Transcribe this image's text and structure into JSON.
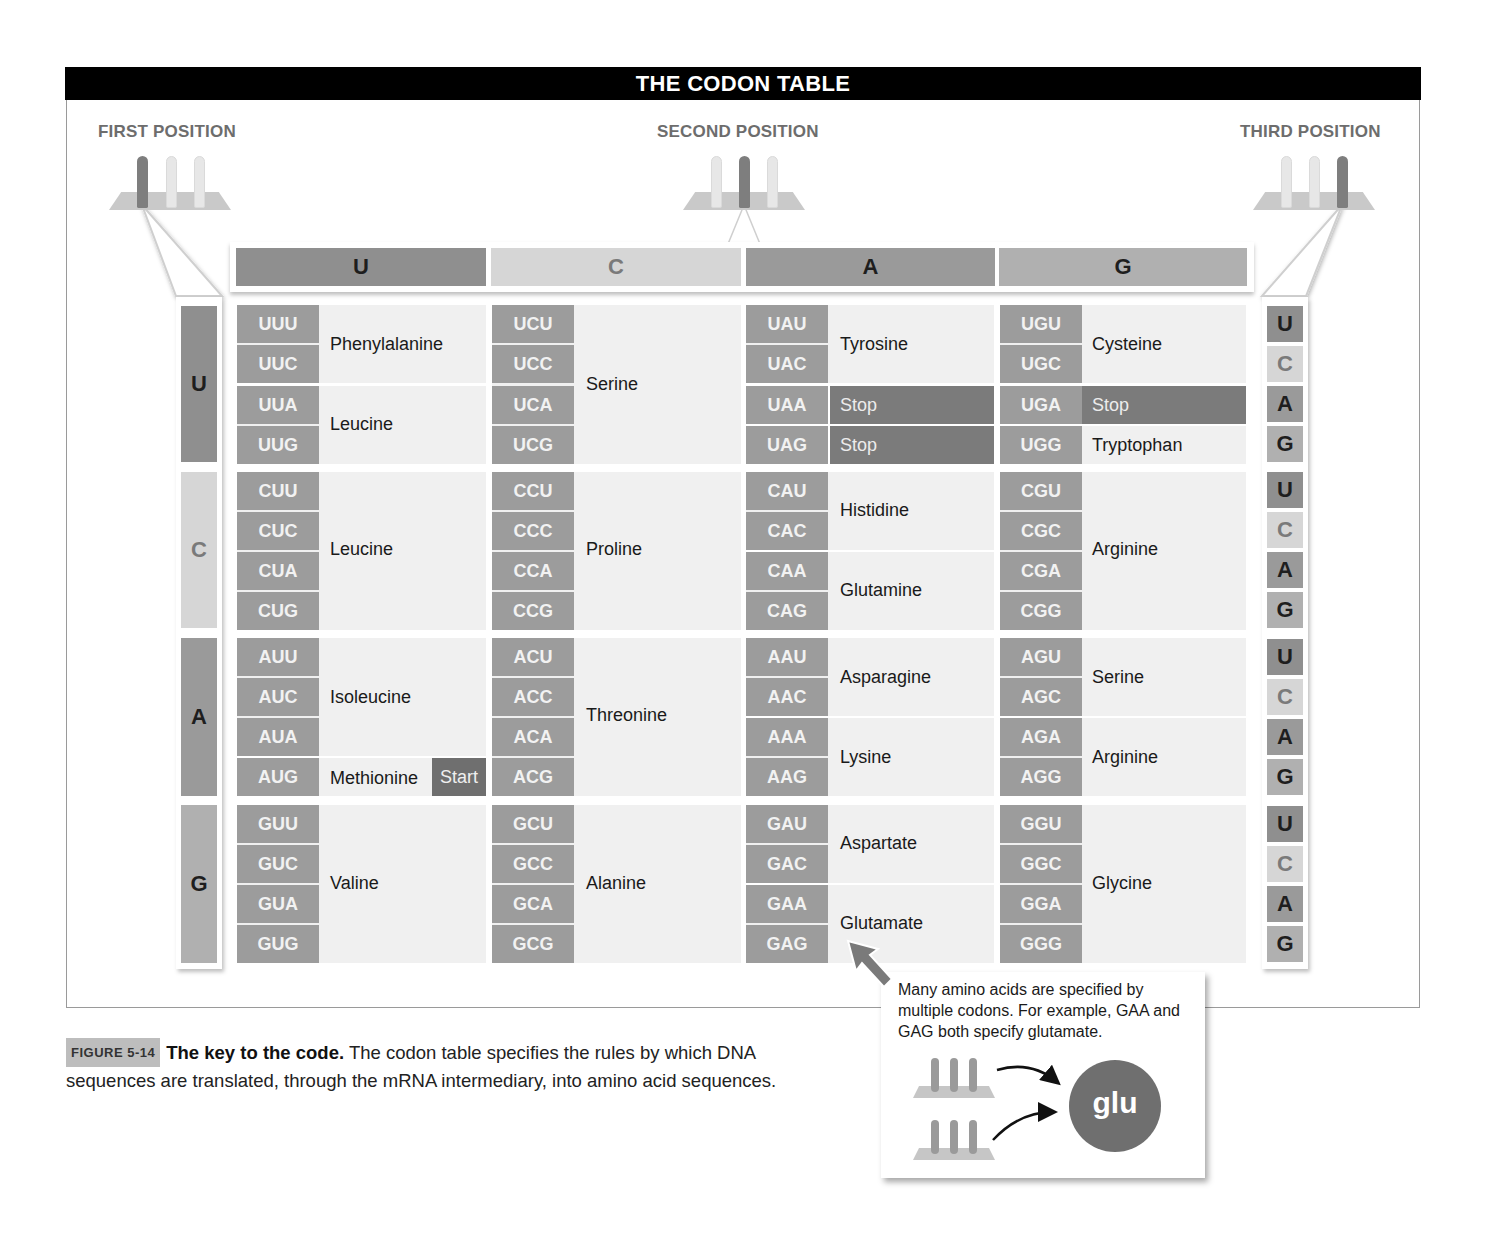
{
  "title": "THE CODON TABLE",
  "positions": {
    "first": "FIRST POSITION",
    "second": "SECOND POSITION",
    "third": "THIRD POSITION"
  },
  "second_headers": [
    "U",
    "C",
    "A",
    "G"
  ],
  "first_labels": [
    "U",
    "C",
    "A",
    "G"
  ],
  "third_labels": [
    "U",
    "C",
    "A",
    "G",
    "U",
    "C",
    "A",
    "G",
    "U",
    "C",
    "A",
    "G",
    "U",
    "C",
    "A",
    "G"
  ],
  "base_colors": {
    "U": "#8f8f8f",
    "C": "#d6d6d6",
    "A": "#9a9a9a",
    "G": "#b0b0b0"
  },
  "base_text_colors": {
    "U": "#1e1e1e",
    "C": "#7a7a7a",
    "A": "#1e1e1e",
    "G": "#1e1e1e"
  },
  "codons": {
    "UU": [
      "UUU",
      "UUC",
      "UUA",
      "UUG"
    ],
    "UC": [
      "UCU",
      "UCC",
      "UCA",
      "UCG"
    ],
    "UA": [
      "UAU",
      "UAC",
      "UAA",
      "UAG"
    ],
    "UG": [
      "UGU",
      "UGC",
      "UGA",
      "UGG"
    ],
    "CU": [
      "CUU",
      "CUC",
      "CUA",
      "CUG"
    ],
    "CC": [
      "CCU",
      "CCC",
      "CCA",
      "CCG"
    ],
    "CA": [
      "CAU",
      "CAC",
      "CAA",
      "CAG"
    ],
    "CG": [
      "CGU",
      "CGC",
      "CGA",
      "CGG"
    ],
    "AU": [
      "AUU",
      "AUC",
      "AUA",
      "AUG"
    ],
    "AC": [
      "ACU",
      "ACC",
      "ACA",
      "ACG"
    ],
    "AA": [
      "AAU",
      "AAC",
      "AAA",
      "AAG"
    ],
    "AG": [
      "AGU",
      "AGC",
      "AGA",
      "AGG"
    ],
    "GU": [
      "GUU",
      "GUC",
      "GUA",
      "GUG"
    ],
    "GC": [
      "GCU",
      "GCC",
      "GCA",
      "GCG"
    ],
    "GA": [
      "GAU",
      "GAC",
      "GAA",
      "GAG"
    ],
    "GG": [
      "GGU",
      "GGC",
      "GGA",
      "GGG"
    ]
  },
  "amino_acids": {
    "UU": [
      "Phenylalanine",
      "Leucine"
    ],
    "UC": [
      "Serine"
    ],
    "UA": [
      "Tyrosine",
      "Stop",
      "Stop"
    ],
    "UG": [
      "Cysteine",
      "Stop",
      "Tryptophan"
    ],
    "CU": [
      "Leucine"
    ],
    "CC": [
      "Proline"
    ],
    "CA": [
      "Histidine",
      "Glutamine"
    ],
    "CG": [
      "Arginine"
    ],
    "AU": [
      "Isoleucine",
      "Methionine",
      "Start"
    ],
    "AC": [
      "Threonine"
    ],
    "AA": [
      "Asparagine",
      "Lysine"
    ],
    "AG": [
      "Serine",
      "Arginine"
    ],
    "GU": [
      "Valine"
    ],
    "GC": [
      "Alanine"
    ],
    "GA": [
      "Aspartate",
      "Glutamate"
    ],
    "GG": [
      "Glycine"
    ]
  },
  "callout": {
    "text": "Many amino acids are specified by multiple codons. For example, GAA and GAG both specify glutamate.",
    "badge": "glu"
  },
  "caption": {
    "tag": "FIGURE 5-14",
    "title": "The key to the code.",
    "body": " The codon table specifies the rules by which DNA sequences are translated, through the mRNA intermediary, into amino acid sequences."
  }
}
